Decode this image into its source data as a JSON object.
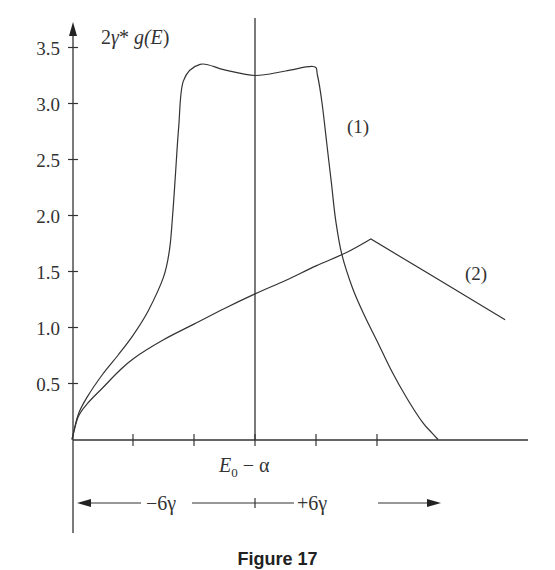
{
  "chart_data": {
    "type": "line",
    "title": "",
    "ylabel": "2γ* g(E)",
    "xlabel": "E₀ − α",
    "x_unit": "γ",
    "xlim": [
      -6,
      8.5
    ],
    "ylim": [
      0,
      3.7
    ],
    "yticks": [
      0.5,
      1.0,
      1.5,
      2.0,
      2.5,
      3.0,
      3.5
    ],
    "ytick_labels": [
      "0.5",
      "1.0",
      "1.5",
      "2.0",
      "2.5",
      "3.0",
      "3.5"
    ],
    "xticks": [
      -4,
      -2,
      0,
      2,
      4
    ],
    "grid": false,
    "legend": "inline labels",
    "range_annotation": {
      "left": "−6γ",
      "right": "+6γ"
    },
    "series": [
      {
        "name": "(1)",
        "x": [
          -6,
          -5.8,
          -5.5,
          -5,
          -4.5,
          -4,
          -3.5,
          -3,
          -2.8,
          -2.7,
          -2.6,
          -2.5,
          -2.35,
          -1.8,
          -1,
          0,
          1,
          1.9,
          2.05,
          2.2,
          2.35,
          2.5,
          2.65,
          2.85,
          3.2,
          3.6,
          4,
          4.5,
          5,
          5.5,
          5.8,
          6
        ],
        "y": [
          0,
          0.22,
          0.38,
          0.58,
          0.75,
          0.93,
          1.15,
          1.45,
          1.7,
          2.0,
          2.4,
          2.8,
          3.2,
          3.35,
          3.3,
          3.25,
          3.29,
          3.33,
          3.25,
          3.0,
          2.65,
          2.3,
          1.95,
          1.65,
          1.35,
          1.1,
          0.88,
          0.6,
          0.36,
          0.15,
          0.06,
          0
        ]
      },
      {
        "name": "(2)",
        "x": [
          -6,
          -5.8,
          -5.5,
          -5,
          -4.5,
          -4,
          -3,
          -2,
          -1,
          0,
          1,
          2,
          3,
          3.8,
          6,
          8.2
        ],
        "y": [
          0,
          0.2,
          0.32,
          0.46,
          0.6,
          0.72,
          0.89,
          1.03,
          1.17,
          1.3,
          1.42,
          1.55,
          1.67,
          1.79,
          1.43,
          1.07
        ]
      }
    ]
  },
  "labels": {
    "y_axis": {
      "prefix": "2",
      "gamma": "γ",
      "star": "*",
      "func": "g(",
      "var": "E",
      "close": ")"
    },
    "x_center": {
      "E": "E",
      "sub": "0",
      "rest": " − α"
    },
    "series1": "(1)",
    "series2": "(2)",
    "range_left": "−6γ",
    "range_right": "+6γ",
    "caption": "Figure 17"
  }
}
